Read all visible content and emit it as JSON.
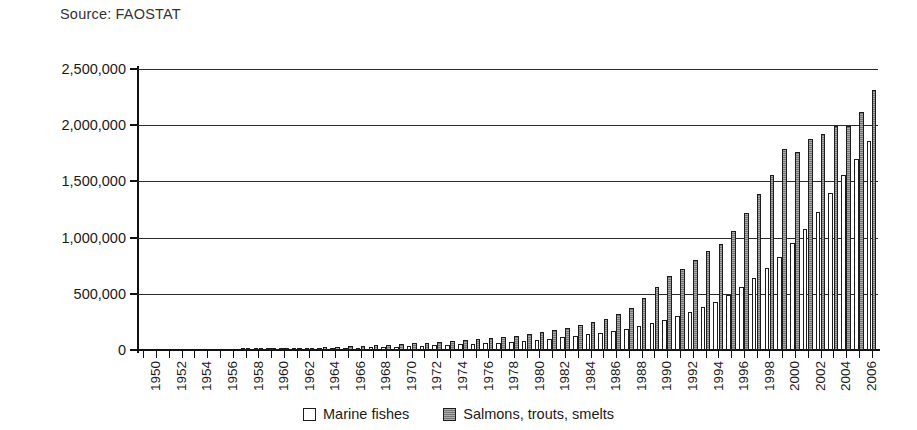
{
  "source_note": "Source: FAOSTAT",
  "legend": {
    "position": "bottom-center",
    "entries": [
      {
        "label": "Marine fishes",
        "swatch": "white-square-icon",
        "color": "#ffffff"
      },
      {
        "label": "Salmons, trouts, smelts",
        "swatch": "gray-square-icon",
        "color": "#8a8a8a"
      }
    ]
  },
  "chart_data": {
    "type": "bar",
    "title": "",
    "subtitle": "",
    "xlabel": "",
    "ylabel": "",
    "grid": true,
    "ylim": [
      0,
      2500000
    ],
    "ytick_labels": [
      "0",
      "500,000",
      "1,000,000",
      "1,500,000",
      "2,000,000",
      "2,500,000"
    ],
    "ytick_values": [
      0,
      500000,
      1000000,
      1500000,
      2000000,
      2500000
    ],
    "xtick_labels_shown_every": 2,
    "categories": [
      "1950",
      "1951",
      "1952",
      "1953",
      "1954",
      "1955",
      "1956",
      "1957",
      "1958",
      "1959",
      "1960",
      "1961",
      "1962",
      "1963",
      "1964",
      "1965",
      "1966",
      "1967",
      "1968",
      "1969",
      "1970",
      "1971",
      "1972",
      "1973",
      "1974",
      "1975",
      "1976",
      "1977",
      "1978",
      "1979",
      "1980",
      "1981",
      "1982",
      "1983",
      "1984",
      "1985",
      "1986",
      "1987",
      "1988",
      "1989",
      "1990",
      "1991",
      "1992",
      "1993",
      "1994",
      "1995",
      "1996",
      "1997",
      "1998",
      "1999",
      "2000",
      "2001",
      "2002",
      "2003",
      "2004",
      "2005",
      "2006",
      "2007"
    ],
    "series": [
      {
        "name": "Marine fishes",
        "color": "#ffffff",
        "values": [
          0,
          0,
          0,
          0,
          0,
          0,
          0,
          0,
          2000,
          4000,
          9000,
          11000,
          12000,
          13000,
          15000,
          17000,
          19000,
          22000,
          24000,
          27000,
          31000,
          35000,
          38000,
          42000,
          46000,
          50000,
          55000,
          60000,
          66000,
          73000,
          80000,
          90000,
          100000,
          112000,
          125000,
          140000,
          155000,
          172000,
          190000,
          215000,
          240000,
          270000,
          300000,
          335000,
          380000,
          430000,
          490000,
          560000,
          640000,
          730000,
          830000,
          950000,
          1080000,
          1230000,
          1400000,
          1560000,
          1700000,
          1860000
        ]
      },
      {
        "name": "Salmons, trouts, smelts",
        "color": "#8a8a8a",
        "values": [
          0,
          0,
          0,
          0,
          0,
          0,
          0,
          0,
          3000,
          6000,
          14000,
          17000,
          19000,
          21000,
          24000,
          28000,
          32000,
          36000,
          41000,
          46000,
          53000,
          60000,
          66000,
          72000,
          80000,
          88000,
          96000,
          105000,
          116000,
          128000,
          140000,
          158000,
          175000,
          196000,
          220000,
          245000,
          275000,
          320000,
          375000,
          460000,
          560000,
          660000,
          720000,
          800000,
          880000,
          945000,
          1060000,
          1220000,
          1390000,
          1560000,
          1790000,
          1760000,
          1880000,
          1920000,
          1990000,
          1990000,
          2120000,
          2310000
        ]
      }
    ]
  }
}
